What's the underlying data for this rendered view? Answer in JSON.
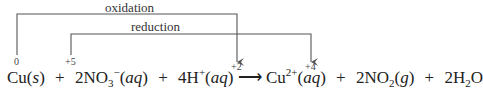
{
  "diagram": {
    "arrows": [
      {
        "label": "oxidation",
        "from": "Cu(s)",
        "to": "Cu2+(aq)"
      },
      {
        "label": "reduction",
        "from": "NO3-(aq)",
        "to": "NO2(g)"
      }
    ],
    "oxidation_states": {
      "cu_reactant": "0",
      "n_reactant": "+5",
      "cu_product": "+2",
      "n_product": "+4"
    },
    "equation": {
      "t1": "Cu(",
      "t1s": "s",
      "t1e": ")",
      "plus": "+",
      "t2c": "2NO",
      "t2sub": "3",
      "t2sup": "−",
      "t2a": "(",
      "t2s": "aq",
      "t2e": ")",
      "t3c": "4H",
      "t3sup": "+",
      "t3a": "(",
      "t3s": "aq",
      "t3e": ")",
      "arrow": "⟶",
      "t4c": "Cu",
      "t4sup": "2+",
      "t4a": "(",
      "t4s": "aq",
      "t4e": ")",
      "t5c": "2NO",
      "t5sub": "2",
      "t5a": "(",
      "t5s": "g",
      "t5e": ")",
      "t6c": "2H",
      "t6sub": "2",
      "t6e": "O"
    },
    "colors": {
      "line": "#555555",
      "text": "#222222"
    }
  }
}
